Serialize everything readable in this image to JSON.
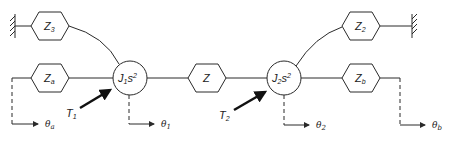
{
  "diagram": {
    "title": "",
    "colors": {
      "line": "#2a2a2a",
      "background": "#ffffff"
    },
    "nodes": {
      "z3": {
        "label": "Z",
        "sub": "3"
      },
      "za": {
        "label": "Z",
        "sub": "a"
      },
      "j1": {
        "label": "J",
        "sub": "1",
        "tail": "s",
        "sup": "2"
      },
      "z": {
        "label": "Z"
      },
      "j2": {
        "label": "J",
        "sub": "2",
        "tail": "s",
        "sup": "2"
      },
      "z2": {
        "label": "Z",
        "sub": "2"
      },
      "zb": {
        "label": "Z",
        "sub": "b"
      }
    },
    "torques": {
      "t1": {
        "label": "T",
        "sub": "1"
      },
      "t2": {
        "label": "T",
        "sub": "2"
      }
    },
    "outputs": {
      "theta_a": {
        "label": "θ",
        "sub": "a"
      },
      "theta_1": {
        "label": "θ",
        "sub": "1"
      },
      "theta_2": {
        "label": "θ",
        "sub": "2"
      },
      "theta_b": {
        "label": "θ",
        "sub": "b"
      }
    },
    "grounds": [
      "left-ground",
      "right-ground"
    ]
  }
}
